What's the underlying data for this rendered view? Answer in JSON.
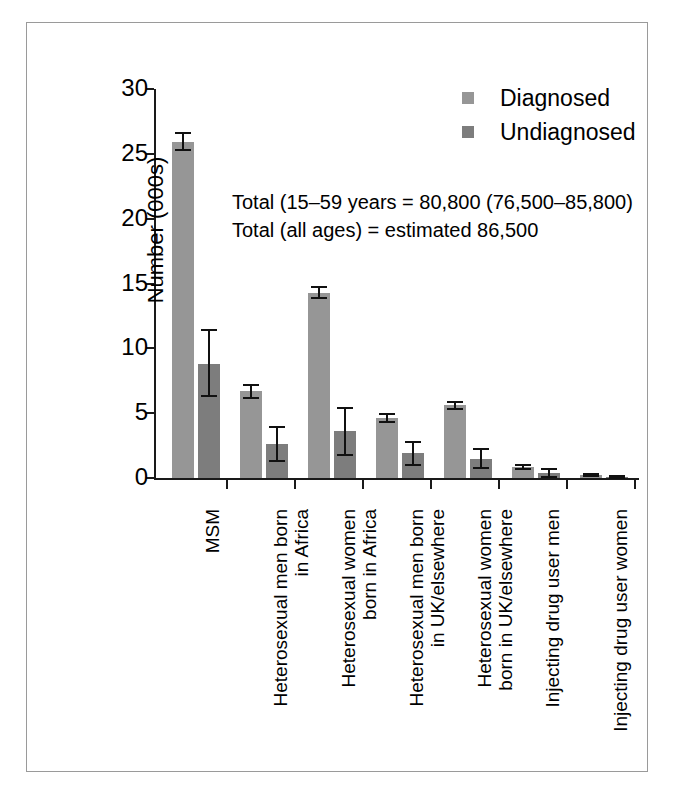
{
  "chart_data": {
    "type": "bar",
    "title": "",
    "xlabel": "",
    "ylabel": "Number (000s)",
    "ylim": [
      0,
      30
    ],
    "yticks": [
      0,
      5,
      10,
      15,
      20,
      25,
      30
    ],
    "ytick_labels": [
      "0",
      "5",
      "10",
      "15",
      "20",
      "25",
      "30"
    ],
    "grid": false,
    "legend_position": "top-right",
    "categories": [
      "MSM",
      "Heterosexual men born in Africa",
      "Heterosexual women born in Africa",
      "Heterosexual men born in UK/elsewhere",
      "Heterosexual women born in UK/elsewhere",
      "Injecting drug user men",
      "Injecting drug user women"
    ],
    "category_lines": [
      [
        "MSM",
        ""
      ],
      [
        "Heterosexual men born",
        "in Africa"
      ],
      [
        "Heterosexual women",
        "born in Africa"
      ],
      [
        "Heterosexual men born",
        "in UK/elsewhere"
      ],
      [
        "Heterosexual women",
        "born in UK/elsewhere"
      ],
      [
        "Injecting drug user men",
        ""
      ],
      [
        "Injecting drug user women",
        ""
      ]
    ],
    "series": [
      {
        "name": "Diagnosed",
        "color": "#969696",
        "values": [
          25.9,
          6.7,
          14.3,
          4.6,
          5.6,
          0.85,
          0.2
        ],
        "err_low": [
          25.3,
          6.2,
          13.9,
          4.3,
          5.3,
          0.7,
          0.12
        ],
        "err_high": [
          26.6,
          7.2,
          14.7,
          4.9,
          5.9,
          1.0,
          0.3
        ]
      },
      {
        "name": "Undiagnosed",
        "color": "#7d7d7d",
        "values": [
          8.8,
          2.6,
          3.6,
          1.9,
          1.5,
          0.35,
          0.05
        ],
        "err_low": [
          6.3,
          1.3,
          1.8,
          1.0,
          0.8,
          0.1,
          0.0
        ],
        "err_high": [
          11.4,
          3.9,
          5.4,
          2.8,
          2.2,
          0.7,
          0.15
        ]
      }
    ],
    "annotations": [
      "Total (15–59 years = 80,800 (76,500–85,800)",
      "Total (all ages) = estimated 86,500"
    ]
  },
  "legend": {
    "items": [
      {
        "label": "Diagnosed",
        "swatch": "#969696"
      },
      {
        "label": "Undiagnosed",
        "swatch": "#7d7d7d"
      }
    ]
  },
  "axis": {
    "y_title": "Number (000s)",
    "ticks": [
      "30",
      "25",
      "20",
      "15",
      "10",
      "5",
      "0"
    ]
  },
  "annotation": {
    "line1": "Total (15–59 years = 80,800 (76,500–85,800)",
    "line2": "Total (all ages) = estimated 86,500"
  },
  "categories": {
    "c0_l1": "MSM",
    "c0_l2": "",
    "c1_l1": "Heterosexual men born",
    "c1_l2": "in Africa",
    "c2_l1": "Heterosexual women",
    "c2_l2": "born in Africa",
    "c3_l1": "Heterosexual men born",
    "c3_l2": "in UK/elsewhere",
    "c4_l1": "Heterosexual women",
    "c4_l2": "born in UK/elsewhere",
    "c5_l1": "Injecting drug user men",
    "c5_l2": "",
    "c6_l1": "Injecting drug user women",
    "c6_l2": ""
  }
}
